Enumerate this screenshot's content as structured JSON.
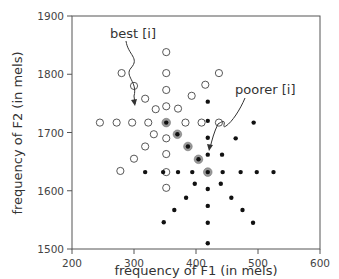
{
  "chart_data": {
    "type": "scatter",
    "title": "",
    "xlabel": "frequency of F1 (in mels)",
    "ylabel": "frequency of F2 (in mels)",
    "xlim": [
      200,
      600
    ],
    "ylim": [
      1500,
      1900
    ],
    "xticks": [
      200,
      300,
      400,
      500,
      600
    ],
    "yticks": [
      1500,
      1600,
      1700,
      1800,
      1900
    ],
    "grid": false,
    "legend": null,
    "annotations": [
      {
        "text": "best [i]",
        "points_to": [
          352,
          1717
        ]
      },
      {
        "text": "poorer [i]",
        "points_to": [
          419,
          1632
        ]
      }
    ],
    "series": [
      {
        "name": "open circles (prototype neighborhood)",
        "marker": "open-circle",
        "points": [
          [
            352,
            1838
          ],
          [
            352,
            1802
          ],
          [
            352,
            1773
          ],
          [
            352,
            1745
          ],
          [
            280,
            1802
          ],
          [
            300,
            1780
          ],
          [
            318,
            1758
          ],
          [
            335,
            1740
          ],
          [
            245,
            1717
          ],
          [
            272,
            1717
          ],
          [
            297,
            1717
          ],
          [
            323,
            1717
          ],
          [
            383,
            1717
          ],
          [
            409,
            1717
          ],
          [
            437,
            1717
          ],
          [
            371,
            1741
          ],
          [
            393,
            1763
          ],
          [
            415,
            1782
          ],
          [
            437,
            1802
          ],
          [
            332,
            1697
          ],
          [
            352,
            1690
          ],
          [
            300,
            1655
          ],
          [
            318,
            1676
          ],
          [
            278,
            1634
          ],
          [
            352,
            1663
          ],
          [
            352,
            1605
          ],
          [
            352,
            1632
          ]
        ]
      },
      {
        "name": "shaded path (best to poorer)",
        "marker": "halo-dot",
        "points": [
          [
            352,
            1717
          ],
          [
            370,
            1697
          ],
          [
            387,
            1676
          ],
          [
            404,
            1654
          ],
          [
            419,
            1632
          ]
        ]
      },
      {
        "name": "filled dots (non-prototype neighborhood)",
        "marker": "filled-dot",
        "points": [
          [
            419,
            1753
          ],
          [
            419,
            1720
          ],
          [
            419,
            1691
          ],
          [
            419,
            1662
          ],
          [
            493,
            1717
          ],
          [
            464,
            1690
          ],
          [
            442,
            1662
          ],
          [
            318,
            1632
          ],
          [
            347,
            1632
          ],
          [
            371,
            1632
          ],
          [
            394,
            1632
          ],
          [
            443,
            1632
          ],
          [
            472,
            1632
          ],
          [
            498,
            1632
          ],
          [
            525,
            1632
          ],
          [
            398,
            1612
          ],
          [
            419,
            1603
          ],
          [
            440,
            1612
          ],
          [
            384,
            1588
          ],
          [
            457,
            1588
          ],
          [
            365,
            1567
          ],
          [
            475,
            1567
          ],
          [
            348,
            1546
          ],
          [
            419,
            1574
          ],
          [
            419,
            1545
          ],
          [
            492,
            1545
          ],
          [
            419,
            1510
          ]
        ]
      }
    ]
  },
  "labels": {
    "xlabel": "frequency of F1 (in mels)",
    "ylabel": "frequency of F2 (in mels)",
    "best": "best [i]",
    "poorer": "poorer [i]",
    "xticks": [
      "200",
      "300",
      "400",
      "500",
      "600"
    ],
    "yticks": [
      "1500",
      "1600",
      "1700",
      "1800",
      "1900"
    ]
  }
}
